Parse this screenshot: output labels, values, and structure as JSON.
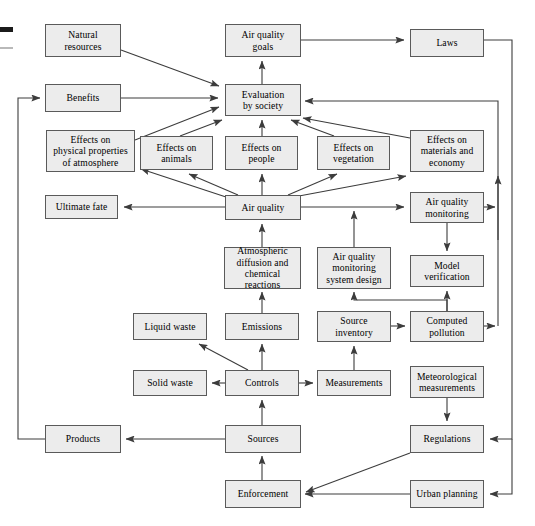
{
  "figure": {
    "kind": "flow-diagram",
    "box_fill": "#ececec",
    "box_stroke": "#5a5a5a",
    "edge_color": "#3c3c3c",
    "background": "#ffffff"
  },
  "marks": {
    "dark_bar_label": "crop-mark-dark",
    "light_bar_label": "crop-mark-light"
  },
  "nodes": [
    {
      "id": "natural_resources",
      "label": "Natural\nresources",
      "x": 45,
      "y": 24,
      "w": 76,
      "h": 33
    },
    {
      "id": "air_quality_goals",
      "label": "Air quality\ngoals",
      "x": 225,
      "y": 24,
      "w": 76,
      "h": 33
    },
    {
      "id": "laws",
      "label": "Laws",
      "x": 410,
      "y": 29,
      "w": 74,
      "h": 28
    },
    {
      "id": "benefits",
      "label": "Benefits",
      "x": 45,
      "y": 84,
      "w": 76,
      "h": 28
    },
    {
      "id": "evaluation_by_society",
      "label": "Evaluation\nby society",
      "x": 225,
      "y": 84,
      "w": 76,
      "h": 32
    },
    {
      "id": "effects_physical_properties",
      "label": "Effects on\nphysical properties\nof atmosphere",
      "x": 46,
      "y": 130,
      "w": 89,
      "h": 42
    },
    {
      "id": "effects_animals",
      "label": "Effects on\nanimals",
      "x": 140,
      "y": 136,
      "w": 73,
      "h": 34
    },
    {
      "id": "effects_people",
      "label": "Effects on\npeople",
      "x": 225,
      "y": 136,
      "w": 73,
      "h": 34
    },
    {
      "id": "effects_vegetation",
      "label": "Effects on\nvegetation",
      "x": 317,
      "y": 136,
      "w": 73,
      "h": 34
    },
    {
      "id": "effects_materials_economy",
      "label": "Effects on\nmaterials and\neconomy",
      "x": 410,
      "y": 130,
      "w": 74,
      "h": 42
    },
    {
      "id": "ultimate_fate",
      "label": "Ultimate fate",
      "x": 45,
      "y": 195,
      "w": 73,
      "h": 24
    },
    {
      "id": "air_quality",
      "label": "Air quality",
      "x": 225,
      "y": 195,
      "w": 76,
      "h": 25
    },
    {
      "id": "air_quality_monitoring",
      "label": "Air quality\nmonitoring",
      "x": 410,
      "y": 192,
      "w": 74,
      "h": 31
    },
    {
      "id": "atmospheric_diffusion",
      "label": "Atmospheric\ndiffusion and\nchemical reactions",
      "x": 224,
      "y": 247,
      "w": 77,
      "h": 42
    },
    {
      "id": "aq_monitoring_system_design",
      "label": "Air quality\nmonitoring\nsystem design",
      "x": 317,
      "y": 247,
      "w": 74,
      "h": 42
    },
    {
      "id": "model_verification",
      "label": "Model\nverification",
      "x": 410,
      "y": 255,
      "w": 74,
      "h": 32
    },
    {
      "id": "liquid_waste",
      "label": "Liquid waste",
      "x": 133,
      "y": 313,
      "w": 74,
      "h": 27
    },
    {
      "id": "emissions",
      "label": "Emissions",
      "x": 225,
      "y": 313,
      "w": 74,
      "h": 27
    },
    {
      "id": "source_inventory",
      "label": "Source\ninventory",
      "x": 317,
      "y": 311,
      "w": 74,
      "h": 31
    },
    {
      "id": "computed_pollution",
      "label": "Computed\npollution",
      "x": 410,
      "y": 311,
      "w": 74,
      "h": 31
    },
    {
      "id": "solid_waste",
      "label": "Solid waste",
      "x": 133,
      "y": 370,
      "w": 74,
      "h": 26
    },
    {
      "id": "controls",
      "label": "Controls",
      "x": 225,
      "y": 370,
      "w": 74,
      "h": 26
    },
    {
      "id": "measurements",
      "label": "Measurements",
      "x": 317,
      "y": 370,
      "w": 74,
      "h": 26
    },
    {
      "id": "meteorological_measurements",
      "label": "Meteorological\nmeasurements",
      "x": 410,
      "y": 366,
      "w": 74,
      "h": 32
    },
    {
      "id": "products",
      "label": "Products",
      "x": 45,
      "y": 425,
      "w": 76,
      "h": 28
    },
    {
      "id": "sources",
      "label": "Sources",
      "x": 225,
      "y": 425,
      "w": 76,
      "h": 28
    },
    {
      "id": "regulations",
      "label": "Regulations",
      "x": 410,
      "y": 425,
      "w": 74,
      "h": 28
    },
    {
      "id": "enforcement",
      "label": "Enforcement",
      "x": 225,
      "y": 480,
      "w": 76,
      "h": 28
    },
    {
      "id": "urban_planning",
      "label": "Urban planning",
      "x": 410,
      "y": 480,
      "w": 74,
      "h": 28
    }
  ],
  "edges": [
    {
      "from": "natural_resources",
      "to": "evaluation_by_society",
      "points": "121,50 222,88"
    },
    {
      "from": "benefits",
      "to": "evaluation_by_society",
      "points": "121,98 221,98"
    },
    {
      "from": "effects_physical_properties",
      "to": "evaluation_by_society",
      "points": "135,140 221,104"
    },
    {
      "from": "effects_animals",
      "to": "evaluation_by_society",
      "points": "185,136 224,119"
    },
    {
      "from": "effects_people",
      "to": "evaluation_by_society",
      "points": "262,136 262,120"
    },
    {
      "from": "effects_vegetation",
      "to": "evaluation_by_society",
      "points": "330,136 292,120"
    },
    {
      "from": "effects_materials_economy",
      "to": "evaluation_by_society",
      "points": "410,140 303,119"
    },
    {
      "from": "air_quality_goals",
      "to": "laws",
      "points": "301,40 407,40"
    },
    {
      "from": "evaluation_by_society",
      "to": "air_quality_goals",
      "points": "262,84 262,60"
    },
    {
      "from": "laws_down_right",
      "to": "regulations",
      "points": "484,40 512,40 512,438 487,438"
    },
    {
      "from": "materials_up_right",
      "to": "evaluation_by_society",
      "points": "484,98 498,98 498,170 498,172"
    },
    {
      "from": "computed_pollution_right",
      "to": "evaluation_by_society",
      "points": "484,326 498,326 498,98 304,98"
    },
    {
      "from": "air_quality_monitoring_right",
      "to": "evaluation_path",
      "points": "484,207 498,207"
    },
    {
      "from": "air_quality",
      "to": "ultimate_fate",
      "points": "225,207 121,207"
    },
    {
      "from": "air_quality",
      "to": "effects_physical_properties",
      "points": "225,198 137,168"
    },
    {
      "from": "air_quality",
      "to": "effects_animals",
      "points": "236,195 186,172"
    },
    {
      "from": "air_quality",
      "to": "effects_people",
      "points": "262,195 262,172"
    },
    {
      "from": "air_quality",
      "to": "effects_vegetation",
      "points": "288,195 340,172"
    },
    {
      "from": "air_quality",
      "to": "effects_materials_economy",
      "points": "298,196 408,175"
    },
    {
      "from": "air_quality",
      "to": "air_quality_monitoring",
      "points": "301,207 407,207"
    },
    {
      "from": "atmospheric_diffusion",
      "to": "air_quality",
      "points": "262,247 262,222"
    },
    {
      "from": "emissions",
      "to": "atmospheric_diffusion",
      "points": "262,313 262,291"
    },
    {
      "from": "aq_monitoring_system_design",
      "to": "air_quality_monitoring_line",
      "points": "354,247 354,210"
    },
    {
      "from": "air_quality_monitoring",
      "to": "model_verification",
      "points": "447,223 447,253"
    },
    {
      "from": "computed_pollution",
      "to": "model_verification",
      "points": "447,311 447,289"
    },
    {
      "from": "source_inventory",
      "to": "computed_pollution",
      "points": "391,326 407,326"
    },
    {
      "from": "computed_pollution_to_design",
      "to": "aq_monitoring_system_design",
      "points": "447,311 447,299 354,299 354,291"
    },
    {
      "from": "controls",
      "to": "liquid_waste",
      "points": "248,370 196,342"
    },
    {
      "from": "controls",
      "to": "solid_waste",
      "points": "225,383 210,383"
    },
    {
      "from": "controls",
      "to": "emissions",
      "points": "262,370 262,342"
    },
    {
      "from": "controls",
      "to": "measurements",
      "points": "299,383 314,383"
    },
    {
      "from": "measurements",
      "to": "source_inventory",
      "points": "354,370 354,344"
    },
    {
      "from": "meteorological_measurements",
      "to": "regulations",
      "points": "447,398 447,422"
    },
    {
      "from": "sources",
      "to": "controls",
      "points": "262,425 262,399"
    },
    {
      "from": "sources",
      "to": "products",
      "points": "225,439 124,439"
    },
    {
      "from": "enforcement",
      "to": "sources",
      "points": "262,480 262,456"
    },
    {
      "from": "regulations",
      "to": "enforcement",
      "points": "410,453 304,494"
    },
    {
      "from": "urban_planning",
      "to": "enforcement",
      "points": "410,494 304,494"
    },
    {
      "from": "right_rail_to_urban_planning",
      "points": "512,438 512,494 487,494"
    },
    {
      "from": "products",
      "to": "benefits",
      "points": "45,439 18,439 18,98 42,98"
    }
  ]
}
